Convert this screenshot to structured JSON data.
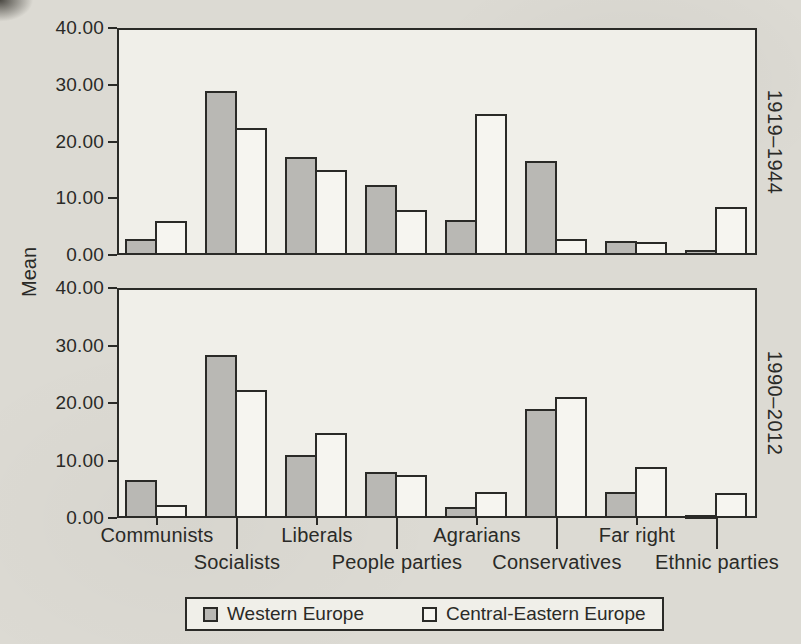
{
  "figure_kind": "scanned book figure",
  "chart_data": {
    "type": "bar",
    "title": "",
    "ylabel": "Mean",
    "categories": [
      "Communists",
      "Socialists",
      "Liberals",
      "People parties",
      "Agrarians",
      "Conservatives",
      "Far right",
      "Ethnic parties"
    ],
    "series_names": [
      "Western Europe",
      "Central-Eastern Europe"
    ],
    "panels": [
      {
        "label": "1919–1944",
        "series": [
          {
            "name": "Western Europe",
            "values": [
              2.8,
              28.9,
              17.3,
              12.3,
              6.2,
              16.5,
              2.4,
              0.8
            ]
          },
          {
            "name": "Central-Eastern Europe",
            "values": [
              6.0,
              22.3,
              15.0,
              8.0,
              24.9,
              2.9,
              2.3,
              8.4
            ]
          }
        ]
      },
      {
        "label": "1990–2012",
        "series": [
          {
            "name": "Western Europe",
            "values": [
              6.6,
              28.3,
              11.0,
              8.0,
              2.0,
              19.0,
              4.5,
              0.4
            ]
          },
          {
            "name": "Central-Eastern Europe",
            "values": [
              2.3,
              22.3,
              14.8,
              7.5,
              4.5,
              21.1,
              8.9,
              4.4
            ]
          }
        ]
      }
    ],
    "ylim": [
      0,
      40
    ],
    "yticks": [
      0,
      10,
      20,
      30,
      40
    ],
    "ytick_decimals": 2,
    "grid": false,
    "legend_position": "bottom",
    "label_layout": "staggered two-row x labels, panel period labels rotated on right side",
    "colors": {
      "western_europe": "#b9b8b4",
      "central_eastern_europe": "#f6f5f0",
      "ink": "#2a2a27",
      "panel_bg": "#f0efe9",
      "page_bg": "#dcdad3"
    }
  },
  "legend": {
    "items": [
      {
        "label": "Western Europe"
      },
      {
        "label": "Central-Eastern Europe"
      }
    ]
  }
}
